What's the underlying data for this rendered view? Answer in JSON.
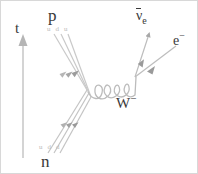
{
  "diagram": {
    "type": "feynman-diagram",
    "background_color": "#ffffff",
    "border_color": "#d8d8d8",
    "line_color": "#b0b0b0",
    "label_color": "#3a3a3a",
    "quark_label_color": "#b9b9b9"
  },
  "axis": {
    "time_label": "t",
    "direction": "up"
  },
  "particles": {
    "proton": {
      "label": "p",
      "quarks": "u d u"
    },
    "neutron": {
      "label": "n",
      "quarks": "u d d"
    },
    "boson": {
      "label": "W",
      "charge": "−"
    },
    "antineutrino": {
      "symbol": "ν",
      "subscript": "e",
      "overline": true
    },
    "electron": {
      "label": "e",
      "charge": "−"
    }
  }
}
